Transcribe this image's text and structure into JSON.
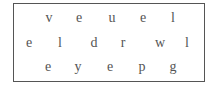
{
  "puzzle": {
    "rows": [
      {
        "letters": [
          "v",
          "e",
          "u",
          "e",
          "l"
        ],
        "y": 18,
        "x": [
          49,
          79,
          112,
          143,
          173
        ]
      },
      {
        "letters": [
          "e",
          "l",
          "d",
          "r",
          "w",
          "l"
        ],
        "y": 43,
        "x": [
          29,
          60,
          94,
          123,
          160,
          187
        ]
      },
      {
        "letters": [
          "e",
          "y",
          "e",
          "p",
          "g"
        ],
        "y": 67,
        "x": [
          48,
          78,
          110,
          142,
          173
        ]
      }
    ],
    "colors": {
      "border": "#555555",
      "text": "#555555",
      "background": "#ffffff"
    }
  }
}
